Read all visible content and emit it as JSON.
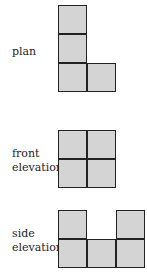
{
  "views": [
    {
      "id": "plan",
      "label_lines": [
        "plan"
      ]
    },
    {
      "id": "front",
      "label_lines": [
        "front",
        "elevation"
      ]
    },
    {
      "id": "side",
      "label_lines": [
        "side",
        "elevation"
      ]
    }
  ],
  "colors": {
    "cell_fill": "#d4d4d4",
    "cell_border": "#222222"
  }
}
